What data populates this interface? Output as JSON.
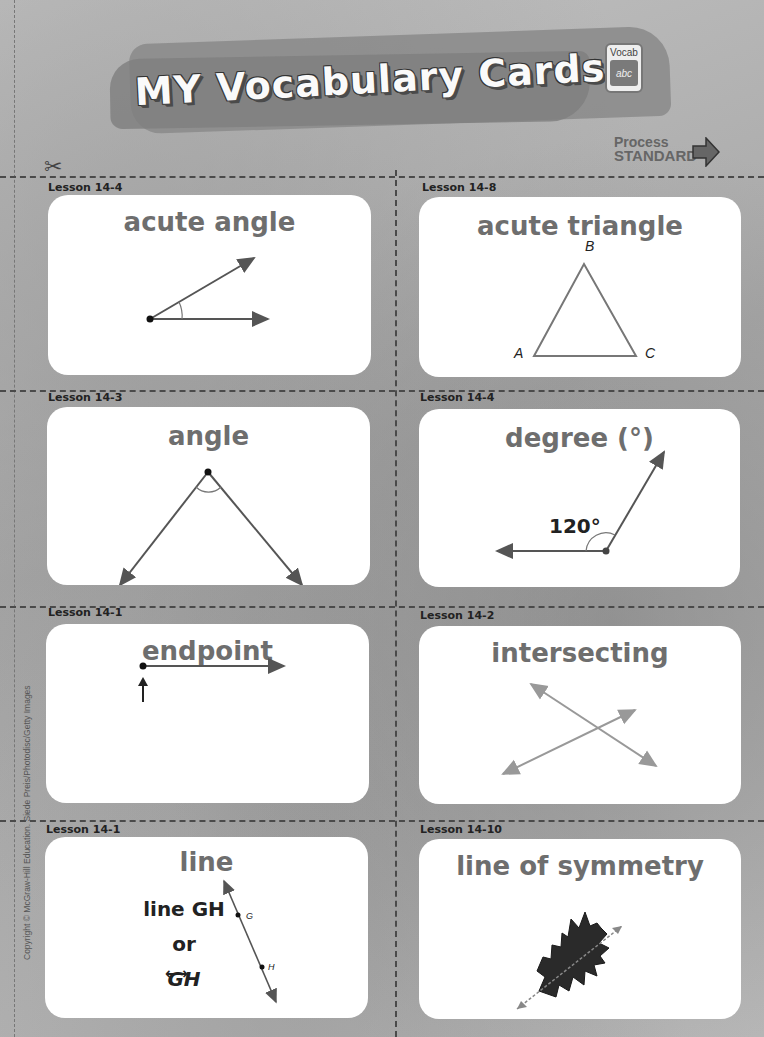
{
  "header": {
    "title": "MY Vocabulary Cards",
    "badge": {
      "label": "Vocab",
      "glyph": "abc"
    },
    "process_standard": {
      "line1": "Process",
      "line2": "STANDARD",
      "icon": "arrow-right-icon"
    }
  },
  "cut_icon": "scissors-icon",
  "cards": [
    {
      "lesson": "Lesson 14-4",
      "term": "acute angle",
      "illustration": "acute angle with vertex and two rays"
    },
    {
      "lesson": "Lesson 14-8",
      "term": "acute triangle",
      "illustration": "triangle",
      "labels": [
        "A",
        "B",
        "C"
      ]
    },
    {
      "lesson": "Lesson 14-3",
      "term": "angle",
      "illustration": "angle opening downward with arc"
    },
    {
      "lesson": "Lesson 14-4",
      "term": "degree (°)",
      "illustration": "120 degree angle",
      "measure": "120°"
    },
    {
      "lesson": "Lesson 14-1",
      "term": "endpoint",
      "illustration": "ray with endpoint marked by arrow"
    },
    {
      "lesson": "Lesson 14-2",
      "term": "intersecting",
      "illustration": "two intersecting lines"
    },
    {
      "lesson": "Lesson 14-1",
      "term": "line",
      "illustration": "line through points G and H",
      "notation": {
        "line1": "line GH",
        "line2": "or",
        "line3": "GH"
      },
      "labels": [
        "G",
        "H"
      ]
    },
    {
      "lesson": "Lesson 14-10",
      "term": "line of symmetry",
      "illustration": "oak leaf with line of symmetry"
    }
  ],
  "credits": "Copyright © McGraw-Hill Education.  Siede Preis/Photodisc/Getty Images"
}
